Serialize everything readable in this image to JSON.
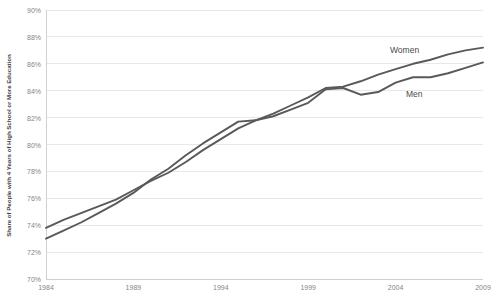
{
  "chart_data": {
    "type": "line",
    "title": "",
    "xlabel": "",
    "ylabel": "Share of People with 4 Years of High School or More Education",
    "xlim": [
      1984,
      2009
    ],
    "ylim": [
      70,
      90
    ],
    "ytick_labels": [
      "90%",
      "88%",
      "86%",
      "84%",
      "82%",
      "80%",
      "78%",
      "76%",
      "74%",
      "72%",
      "70%"
    ],
    "ytick_values": [
      90,
      88,
      86,
      84,
      82,
      80,
      78,
      76,
      74,
      72,
      70
    ],
    "xtick_labels": [
      "1984",
      "1989",
      "1994",
      "1999",
      "2004",
      "2009"
    ],
    "xtick_values": [
      1984,
      1989,
      1994,
      1999,
      2004,
      2009
    ],
    "grid": "horizontal",
    "legend_position": "inline-annotation",
    "line_color": "#595959",
    "grid_color": "#e8e8e8",
    "axis_color": "#d0d0d0",
    "x": [
      1984,
      1985,
      1986,
      1987,
      1988,
      1989,
      1990,
      1991,
      1992,
      1993,
      1994,
      1995,
      1996,
      1997,
      1998,
      1999,
      2000,
      2001,
      2002,
      2003,
      2004,
      2005,
      2006,
      2007,
      2008,
      2009
    ],
    "series": [
      {
        "name": "Women",
        "values": [
          73.0,
          73.6,
          74.2,
          74.9,
          75.6,
          76.4,
          77.4,
          78.2,
          79.2,
          80.1,
          80.9,
          81.7,
          81.8,
          82.3,
          82.9,
          83.5,
          84.2,
          84.3,
          84.7,
          85.2,
          85.6,
          86.0,
          86.3,
          86.7,
          87.0,
          87.2
        ],
        "color": "#595959"
      },
      {
        "name": "Men",
        "values": [
          73.8,
          74.4,
          74.9,
          75.4,
          75.9,
          76.6,
          77.3,
          77.9,
          78.7,
          79.6,
          80.4,
          81.2,
          81.8,
          82.1,
          82.6,
          83.1,
          84.1,
          84.2,
          83.7,
          83.9,
          84.6,
          85.0,
          85.0,
          85.3,
          85.7,
          86.1
        ],
        "color": "#595959"
      }
    ],
    "annotations": [
      {
        "text": "Women",
        "x_px": 390,
        "y_px": 45
      },
      {
        "text": "Men",
        "x_px": 406,
        "y_px": 89
      }
    ]
  },
  "caption": ""
}
